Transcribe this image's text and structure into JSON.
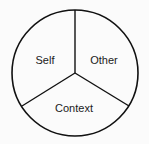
{
  "diagram": {
    "type": "three-segment-circle",
    "segments": [
      {
        "label": "Self",
        "position": "upper-left"
      },
      {
        "label": "Other",
        "position": "upper-right"
      },
      {
        "label": "Context",
        "position": "bottom"
      }
    ],
    "stroke_color": "#111111",
    "background": "#fbfbfb"
  }
}
